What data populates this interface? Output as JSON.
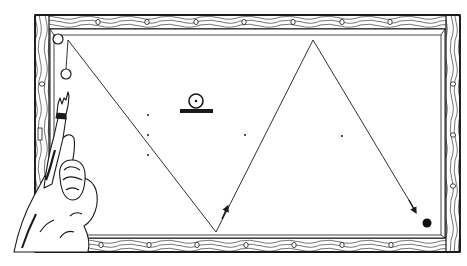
{
  "figure": {
    "subject": "Billiard table shot diagram: a player points at the table showing a cue-ball path bouncing off cushions",
    "colors": {
      "ink": "#1a1a1a",
      "paper": "#ffffff",
      "wood_grain": "#3a3a3a"
    }
  },
  "table": {
    "outer": {
      "x": 35,
      "y": 15,
      "w": 425,
      "h": 237
    },
    "cushion": {
      "x": 50,
      "y": 29,
      "w": 393,
      "h": 207
    },
    "top_diamonds_x": [
      98,
      147,
      196,
      244,
      293,
      342,
      390
    ],
    "bottom_diamonds_x": [
      101,
      149,
      197,
      246,
      294,
      342,
      391
    ],
    "right_diamonds_y": [
      84,
      135,
      186
    ],
    "left_diamonds_y": [
      84
    ]
  },
  "balls": {
    "corner_ball": {
      "cx": 58,
      "cy": 39,
      "r": 5
    },
    "cue_ball": {
      "cx": 66,
      "cy": 74,
      "r": 5
    },
    "object_ball_black": {
      "cx": 427,
      "cy": 223,
      "r": 4.5
    }
  },
  "shot_path": {
    "points": [
      [
        68,
        40
      ],
      [
        216,
        232
      ],
      [
        313,
        40
      ],
      [
        416,
        212
      ]
    ],
    "vertical_guide": [
      [
        68,
        40
      ],
      [
        66,
        69
      ]
    ],
    "arrows": [
      {
        "x": 226,
        "y": 210,
        "angle": -63
      },
      {
        "x": 415,
        "y": 210,
        "angle": 59
      }
    ]
  },
  "reference_dots": [
    [
      148,
      115
    ],
    [
      148,
      135
    ],
    [
      148,
      155
    ],
    [
      245,
      135
    ],
    [
      342,
      136
    ]
  ],
  "legend_symbol": {
    "label": "ball-on-cushion symbol",
    "cx": 196,
    "cy": 101,
    "r": 7,
    "bar": {
      "x": 180,
      "y": 110,
      "w": 33,
      "h": 3
    }
  },
  "person": {
    "description": "Man seen from behind, right arm raised pointing at the cue ball near the left cushion"
  }
}
